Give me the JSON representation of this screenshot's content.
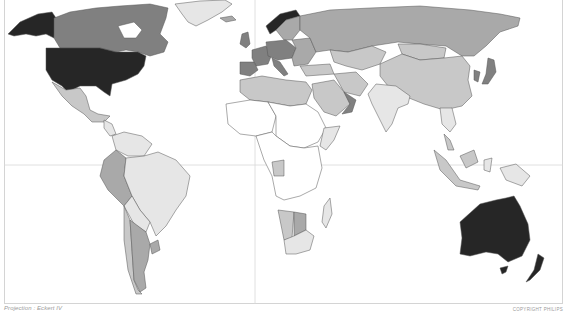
{
  "map": {
    "type": "choropleth world map",
    "projection_label": "Projection : Eckert IV",
    "copyright_label": "COPYRIGHT PHILIPS",
    "graticule": {
      "equator": true,
      "prime_meridian": true
    },
    "colors": {
      "background": "#ffffff",
      "shade_0": "#ffffff",
      "shade_1": "#e6e6e6",
      "shade_2": "#c8c8c8",
      "shade_3": "#a9a9a9",
      "shade_4": "#808080",
      "shade_5": "#262626",
      "border": "#555555",
      "graticule": "#d8d8d8"
    },
    "shading": {
      "darkest": [
        "United States",
        "Australia",
        "Norway"
      ],
      "dark": [
        "Canada",
        "Germany",
        "Spain",
        "France",
        "Italy",
        "Poland",
        "Greenland coast",
        "Japan",
        "Oman",
        "New Zealand"
      ],
      "medium": [
        "Russia",
        "Kazakhstan",
        "Peru",
        "Argentina",
        "Namibia",
        "Botswana",
        "Saudi Arabia",
        "Sweden",
        "Finland"
      ],
      "light": [
        "Mexico",
        "Brazil",
        "China",
        "Mongolia",
        "Libya",
        "Algeria",
        "Egypt",
        "Iran",
        "Colombia",
        "Bolivia",
        "Chile",
        "Venezuela",
        "Malaysia",
        "Indonesia",
        "Gabon",
        "South Africa",
        "Somalia",
        "Madagascar",
        "Greenland"
      ],
      "lightest": [
        "India",
        "Papua New Guinea",
        "Ethiopia"
      ],
      "none": [
        "Central Africa",
        "West Africa",
        "Sudan"
      ]
    }
  }
}
